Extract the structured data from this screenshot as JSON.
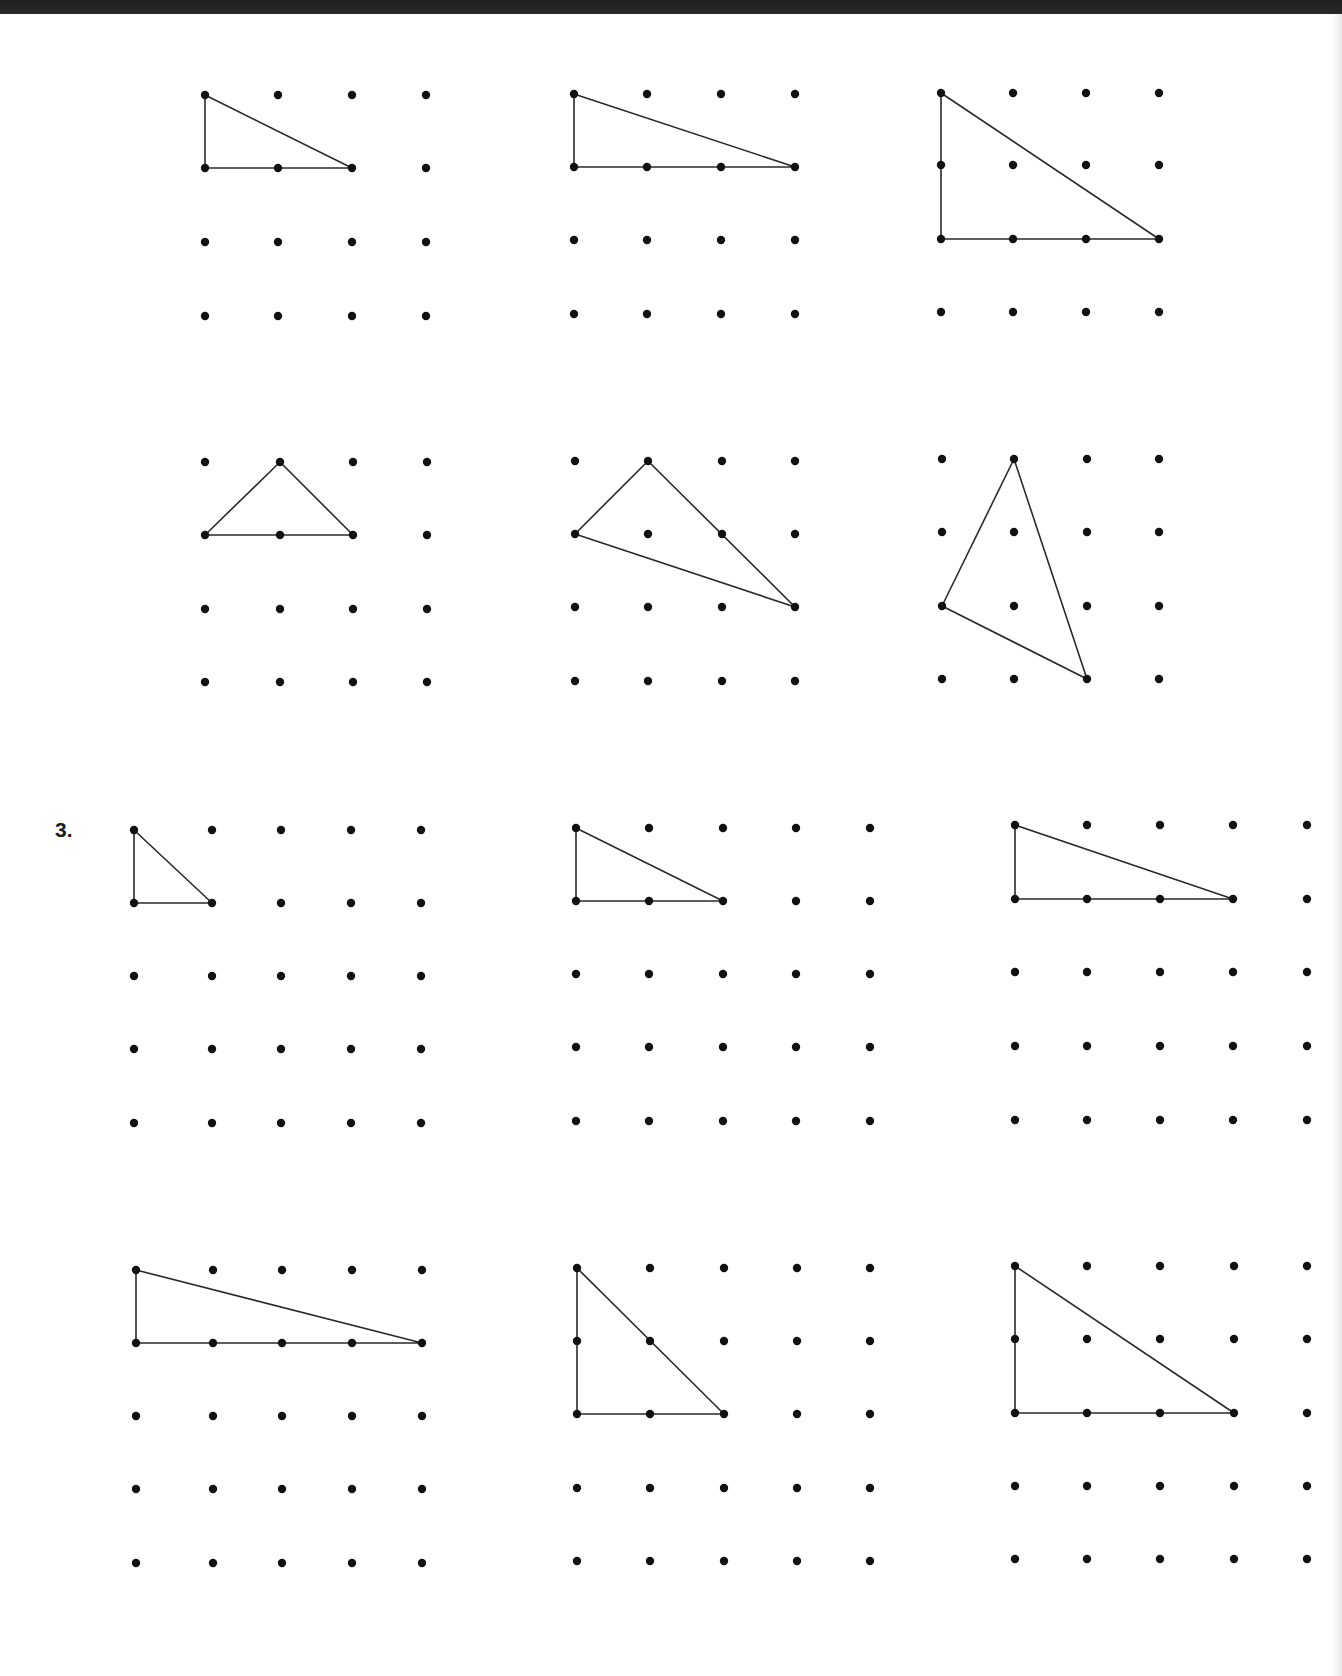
{
  "page": {
    "background": "#ffffff",
    "top_band_color": "#222222",
    "ink_color": "#111111"
  },
  "problem_label": "3.",
  "grids": [
    {
      "id": 1,
      "section": "previous",
      "cols": 4,
      "rows": 4,
      "xs": [
        205,
        278,
        352,
        426
      ],
      "ys": [
        95,
        168,
        242,
        316
      ],
      "triangle": [
        [
          0,
          0
        ],
        [
          0,
          1
        ],
        [
          2,
          1
        ]
      ]
    },
    {
      "id": 2,
      "section": "previous",
      "cols": 4,
      "rows": 4,
      "xs": [
        574,
        647,
        721,
        795
      ],
      "ys": [
        94,
        167,
        240,
        314
      ],
      "triangle": [
        [
          0,
          0
        ],
        [
          0,
          1
        ],
        [
          3,
          1
        ]
      ]
    },
    {
      "id": 3,
      "section": "previous",
      "cols": 4,
      "rows": 4,
      "xs": [
        941,
        1013,
        1086,
        1159
      ],
      "ys": [
        93,
        165,
        239,
        312
      ],
      "triangle": [
        [
          0,
          0
        ],
        [
          0,
          2
        ],
        [
          3,
          2
        ]
      ]
    },
    {
      "id": 4,
      "section": "previous",
      "cols": 4,
      "rows": 4,
      "xs": [
        205,
        280,
        353,
        427
      ],
      "ys": [
        462,
        535,
        609,
        682
      ],
      "triangle": [
        [
          0,
          1
        ],
        [
          1,
          0
        ],
        [
          2,
          1
        ]
      ]
    },
    {
      "id": 5,
      "section": "previous",
      "cols": 4,
      "rows": 4,
      "xs": [
        575,
        648,
        722,
        795
      ],
      "ys": [
        461,
        534,
        607,
        681
      ],
      "triangle": [
        [
          1,
          0
        ],
        [
          0,
          1
        ],
        [
          3,
          2
        ]
      ]
    },
    {
      "id": 6,
      "section": "previous",
      "cols": 4,
      "rows": 4,
      "xs": [
        942,
        1014,
        1087,
        1159
      ],
      "ys": [
        459,
        532,
        606,
        679
      ],
      "triangle": [
        [
          1,
          0
        ],
        [
          0,
          2
        ],
        [
          2,
          3
        ]
      ]
    },
    {
      "id": 7,
      "section": "3",
      "cols": 5,
      "rows": 5,
      "xs": [
        134,
        212,
        281,
        351,
        421
      ],
      "ys": [
        830,
        903,
        976,
        1049,
        1123
      ],
      "triangle": [
        [
          0,
          0
        ],
        [
          0,
          1
        ],
        [
          1,
          1
        ]
      ]
    },
    {
      "id": 8,
      "section": "3",
      "cols": 5,
      "rows": 5,
      "xs": [
        576,
        649,
        723,
        796,
        870
      ],
      "ys": [
        828,
        901,
        974,
        1047,
        1121
      ],
      "triangle": [
        [
          0,
          0
        ],
        [
          0,
          1
        ],
        [
          2,
          1
        ]
      ]
    },
    {
      "id": 9,
      "section": "3",
      "cols": 5,
      "rows": 5,
      "xs": [
        1015,
        1087,
        1160,
        1233,
        1307
      ],
      "ys": [
        825,
        899,
        972,
        1046,
        1120
      ],
      "triangle": [
        [
          0,
          0
        ],
        [
          0,
          1
        ],
        [
          3,
          1
        ]
      ]
    },
    {
      "id": 10,
      "section": "3",
      "cols": 5,
      "rows": 5,
      "xs": [
        136,
        213,
        282,
        352,
        422
      ],
      "ys": [
        1270,
        1343,
        1416,
        1489,
        1563
      ],
      "triangle": [
        [
          0,
          0
        ],
        [
          0,
          1
        ],
        [
          4,
          1
        ]
      ]
    },
    {
      "id": 11,
      "section": "3",
      "cols": 5,
      "rows": 5,
      "xs": [
        577,
        650,
        724,
        797,
        870
      ],
      "ys": [
        1268,
        1341,
        1414,
        1488,
        1561
      ],
      "triangle": [
        [
          0,
          0
        ],
        [
          0,
          2
        ],
        [
          2,
          2
        ]
      ]
    },
    {
      "id": 12,
      "section": "3",
      "cols": 5,
      "rows": 5,
      "xs": [
        1015,
        1087,
        1160,
        1234,
        1307
      ],
      "ys": [
        1266,
        1339,
        1413,
        1486,
        1559
      ],
      "triangle": [
        [
          0,
          0
        ],
        [
          0,
          2
        ],
        [
          3,
          2
        ]
      ]
    }
  ]
}
